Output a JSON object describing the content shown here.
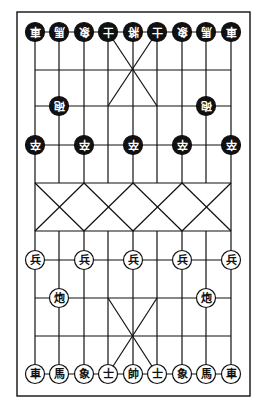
{
  "board": {
    "title": "Xiangqi (Chinese chess) starting position diagram",
    "outer_border": {
      "x1": 17,
      "y1": 12,
      "x2": 250,
      "y2": 396
    },
    "columns_x": [
      35,
      59,
      84,
      108,
      133,
      157,
      182,
      206,
      231
    ],
    "rows_y": [
      32,
      70,
      106,
      145,
      183,
      231,
      260,
      298,
      336,
      374
    ],
    "colors": {
      "line": "#111111",
      "black_piece_fill": "#111111",
      "black_piece_text": "#ffffff",
      "red_piece_fill": "#ffffff",
      "red_piece_text": "#111111",
      "background": "#ffffff"
    }
  },
  "pieces": {
    "black": [
      {
        "name": "chariot",
        "label": "車",
        "col": 0,
        "row": 0
      },
      {
        "name": "horse",
        "label": "馬",
        "col": 1,
        "row": 0
      },
      {
        "name": "elephant",
        "label": "象",
        "col": 2,
        "row": 0
      },
      {
        "name": "advisor",
        "label": "士",
        "col": 3,
        "row": 0
      },
      {
        "name": "general",
        "label": "將",
        "col": 4,
        "row": 0
      },
      {
        "name": "advisor",
        "label": "士",
        "col": 5,
        "row": 0
      },
      {
        "name": "elephant",
        "label": "象",
        "col": 6,
        "row": 0
      },
      {
        "name": "horse",
        "label": "馬",
        "col": 7,
        "row": 0
      },
      {
        "name": "chariot",
        "label": "車",
        "col": 8,
        "row": 0
      },
      {
        "name": "cannon",
        "label": "砲",
        "col": 1,
        "row": 2
      },
      {
        "name": "cannon",
        "label": "砲",
        "col": 7,
        "row": 2
      },
      {
        "name": "soldier",
        "label": "卒",
        "col": 0,
        "row": 3
      },
      {
        "name": "soldier",
        "label": "卒",
        "col": 2,
        "row": 3
      },
      {
        "name": "soldier",
        "label": "卒",
        "col": 4,
        "row": 3
      },
      {
        "name": "soldier",
        "label": "卒",
        "col": 6,
        "row": 3
      },
      {
        "name": "soldier",
        "label": "卒",
        "col": 8,
        "row": 3
      }
    ],
    "red": [
      {
        "name": "soldier",
        "label": "兵",
        "col": 0,
        "row": 6
      },
      {
        "name": "soldier",
        "label": "兵",
        "col": 2,
        "row": 6
      },
      {
        "name": "soldier",
        "label": "兵",
        "col": 4,
        "row": 6
      },
      {
        "name": "soldier",
        "label": "兵",
        "col": 6,
        "row": 6
      },
      {
        "name": "soldier",
        "label": "兵",
        "col": 8,
        "row": 6
      },
      {
        "name": "cannon",
        "label": "炮",
        "col": 1,
        "row": 7
      },
      {
        "name": "cannon",
        "label": "炮",
        "col": 7,
        "row": 7
      },
      {
        "name": "chariot",
        "label": "車",
        "col": 0,
        "row": 9
      },
      {
        "name": "horse",
        "label": "馬",
        "col": 1,
        "row": 9
      },
      {
        "name": "elephant",
        "label": "象",
        "col": 2,
        "row": 9
      },
      {
        "name": "advisor",
        "label": "士",
        "col": 3,
        "row": 9
      },
      {
        "name": "general",
        "label": "帥",
        "col": 4,
        "row": 9
      },
      {
        "name": "advisor",
        "label": "士",
        "col": 5,
        "row": 9
      },
      {
        "name": "elephant",
        "label": "象",
        "col": 6,
        "row": 9
      },
      {
        "name": "horse",
        "label": "馬",
        "col": 7,
        "row": 9
      },
      {
        "name": "chariot",
        "label": "車",
        "col": 8,
        "row": 9
      }
    ]
  }
}
